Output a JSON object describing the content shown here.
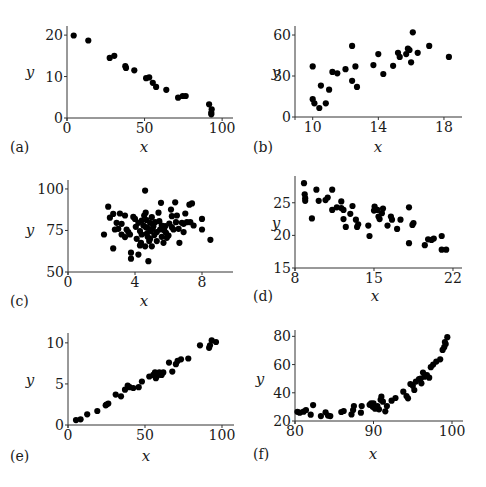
{
  "figure": {
    "background": "#ffffff",
    "point_color": "#000000",
    "axis_color": "#333333"
  },
  "chart_data": [
    {
      "id": "a",
      "type": "scatter",
      "panel_label": "(a)",
      "xlabel": "x",
      "ylabel": "y",
      "xlim": [
        0,
        107
      ],
      "ylim": [
        0,
        22
      ],
      "xticks": [
        0,
        50,
        100
      ],
      "yticks": [
        0,
        10,
        20
      ],
      "grid": false,
      "box": {
        "x0": 67,
        "x1": 233,
        "y0": 118,
        "y1": 26,
        "xmin": 0,
        "xmax": 107,
        "ymin": 0,
        "ymax": 22.2,
        "labelx": 10,
        "labely": 152,
        "axlabelx": 144,
        "axlabely": 152,
        "ylabx": 30,
        "ylaby": 77
      },
      "points": [
        [
          4.3,
          19.9
        ],
        [
          13.7,
          18.7
        ],
        [
          27.5,
          14.5
        ],
        [
          30.5,
          15.0
        ],
        [
          37.6,
          12.5
        ],
        [
          38.0,
          12.1
        ],
        [
          43.4,
          11.5
        ],
        [
          51.0,
          9.6
        ],
        [
          53.0,
          9.8
        ],
        [
          55.3,
          8.5
        ],
        [
          57.4,
          7.5
        ],
        [
          64.0,
          6.8
        ],
        [
          71.6,
          4.9
        ],
        [
          74.6,
          5.3
        ],
        [
          76.5,
          5.3
        ],
        [
          91.6,
          3.3
        ],
        [
          93.3,
          2.1
        ],
        [
          93.0,
          1.3
        ],
        [
          93.0,
          0.9
        ]
      ]
    },
    {
      "id": "b",
      "type": "scatter",
      "panel_label": "(b)",
      "xlabel": "x",
      "ylabel": "y",
      "xlim": [
        9.2,
        19.3
      ],
      "ylim": [
        0,
        66
      ],
      "xticks": [
        10,
        14,
        18
      ],
      "yticks": [
        0,
        30,
        60
      ],
      "grid": false,
      "box": {
        "x0": 295,
        "x1": 462,
        "y0": 117,
        "y1": 26,
        "xmin": 8.92,
        "xmax": 19.1,
        "ymin": 0,
        "ymax": 66.6,
        "labelx": 253,
        "labely": 152,
        "axlabelx": 378,
        "axlabely": 152,
        "ylabx": 276,
        "ylaby": 77
      },
      "points": [
        [
          10.0,
          37
        ],
        [
          10.0,
          13
        ],
        [
          10.1,
          10
        ],
        [
          10.4,
          6.6
        ],
        [
          10.5,
          23
        ],
        [
          10.8,
          10
        ],
        [
          11.0,
          20
        ],
        [
          11.2,
          33
        ],
        [
          11.5,
          32
        ],
        [
          12.0,
          35
        ],
        [
          12.4,
          52
        ],
        [
          12.4,
          26.5
        ],
        [
          12.6,
          37
        ],
        [
          12.7,
          22
        ],
        [
          13.7,
          38
        ],
        [
          14.0,
          46
        ],
        [
          14.3,
          31.5
        ],
        [
          14.9,
          37.5
        ],
        [
          15.2,
          47
        ],
        [
          15.3,
          44
        ],
        [
          15.7,
          46
        ],
        [
          15.8,
          50
        ],
        [
          15.9,
          49
        ],
        [
          16.0,
          40
        ],
        [
          16.1,
          62
        ],
        [
          16.4,
          47
        ],
        [
          17.1,
          52
        ],
        [
          18.3,
          44
        ]
      ]
    },
    {
      "id": "c",
      "type": "scatter",
      "panel_label": "(c)",
      "xlabel": "x",
      "ylabel": "y",
      "xlim": [
        0,
        9.8
      ],
      "ylim": [
        50,
        105
      ],
      "xticks": [
        0,
        4,
        8
      ],
      "yticks": [
        50,
        75,
        100
      ],
      "grid": false,
      "box": {
        "x0": 68,
        "x1": 233,
        "y0": 272,
        "y1": 180,
        "xmin": 0,
        "xmax": 9.85,
        "ymin": 50,
        "ymax": 105.4,
        "labelx": 10,
        "labely": 306,
        "axlabelx": 144,
        "axlabely": 306,
        "ylabx": 30,
        "ylaby": 235
      },
      "points": [
        [
          2.15,
          72.6
        ],
        [
          2.4,
          89.3
        ],
        [
          2.5,
          82.7
        ],
        [
          2.7,
          85
        ],
        [
          2.8,
          75.6
        ],
        [
          2.7,
          64.2
        ],
        [
          2.9,
          79.6
        ],
        [
          3.1,
          85.2
        ],
        [
          3.2,
          79
        ],
        [
          3.2,
          72.6
        ],
        [
          3.4,
          84
        ],
        [
          3.5,
          75.6
        ],
        [
          3.6,
          74
        ],
        [
          3.7,
          72.6
        ],
        [
          3.76,
          61.6
        ],
        [
          3.76,
          58
        ],
        [
          3.9,
          83.2
        ],
        [
          4.05,
          77.2
        ],
        [
          4.2,
          60.5
        ],
        [
          4.2,
          79.6
        ],
        [
          4.3,
          74.6
        ],
        [
          4.36,
          67.6
        ],
        [
          4.4,
          72.6
        ],
        [
          4.5,
          78
        ],
        [
          4.6,
          65.5
        ],
        [
          4.6,
          99
        ],
        [
          4.64,
          85.7
        ],
        [
          4.7,
          81.2
        ],
        [
          4.73,
          76.6
        ],
        [
          4.76,
          71.2
        ],
        [
          4.8,
          56.5
        ],
        [
          4.85,
          68.6
        ],
        [
          4.9,
          79.6
        ],
        [
          4.94,
          74.6
        ],
        [
          5.0,
          65.5
        ],
        [
          5.1,
          77.6
        ],
        [
          5.15,
          72.2
        ],
        [
          5.3,
          68.6
        ],
        [
          5.4,
          85.7
        ],
        [
          5.45,
          80.6
        ],
        [
          5.5,
          75.6
        ],
        [
          5.55,
          91.7
        ],
        [
          5.6,
          71.2
        ],
        [
          5.7,
          67.6
        ],
        [
          5.8,
          77.6
        ],
        [
          5.85,
          73.6
        ],
        [
          5.9,
          70.6
        ],
        [
          6.05,
          79.2
        ],
        [
          6.15,
          87.6
        ],
        [
          6.2,
          83.6
        ],
        [
          6.3,
          75.6
        ],
        [
          6.4,
          92
        ],
        [
          6.45,
          80
        ],
        [
          6.6,
          76
        ],
        [
          6.65,
          67.6
        ],
        [
          6.8,
          79.6
        ],
        [
          6.9,
          74
        ],
        [
          7.0,
          85.2
        ],
        [
          7.1,
          80
        ],
        [
          7.25,
          90.5
        ],
        [
          7.4,
          91.3
        ],
        [
          7.5,
          78
        ],
        [
          8.0,
          82
        ],
        [
          8.0,
          75.6
        ],
        [
          8.5,
          69.4
        ],
        [
          4.4,
          81
        ],
        [
          4.55,
          84
        ],
        [
          4.7,
          73
        ],
        [
          5.0,
          83
        ],
        [
          5.3,
          74
        ],
        [
          5.6,
          78
        ],
        [
          3.0,
          76
        ],
        [
          3.4,
          71
        ],
        [
          4.1,
          70
        ],
        [
          4.3,
          66
        ],
        [
          4.9,
          70
        ],
        [
          5.2,
          80
        ],
        [
          6.0,
          72
        ],
        [
          6.2,
          77
        ],
        [
          6.5,
          84
        ],
        [
          6.9,
          79
        ],
        [
          7.3,
          80
        ],
        [
          4.0,
          82
        ],
        [
          4.65,
          77
        ],
        [
          5.05,
          76
        ],
        [
          5.75,
          75
        ]
      ]
    },
    {
      "id": "d",
      "type": "scatter",
      "panel_label": "(d)",
      "xlabel": "x",
      "ylabel": "y",
      "xlim": [
        8,
        23.2
      ],
      "ylim": [
        15,
        29
      ],
      "xticks": [
        8,
        15,
        22
      ],
      "yticks": [
        15,
        20,
        25
      ],
      "grid": false,
      "box": {
        "x0": 295,
        "x1": 462,
        "y0": 268,
        "y1": 176,
        "xmin": 8,
        "xmax": 22.8,
        "ymin": 15,
        "ymax": 29.1,
        "labelx": 253,
        "labely": 301,
        "axlabelx": 375,
        "axlabely": 301,
        "ylabx": 276,
        "ylaby": 228
      },
      "points": [
        [
          8.8,
          28
        ],
        [
          8.86,
          26.3
        ],
        [
          8.9,
          25.7
        ],
        [
          8.9,
          25.3
        ],
        [
          9.5,
          22.6
        ],
        [
          9.9,
          27
        ],
        [
          10.1,
          25.3
        ],
        [
          10.7,
          25.4
        ],
        [
          10.9,
          25.8
        ],
        [
          11.3,
          27
        ],
        [
          11.3,
          23.9
        ],
        [
          11.7,
          24.3
        ],
        [
          12.1,
          25.2
        ],
        [
          12.1,
          24.2
        ],
        [
          12.3,
          23.9
        ],
        [
          12.3,
          22.5
        ],
        [
          12.5,
          21.3
        ],
        [
          12.9,
          23.3
        ],
        [
          13.1,
          24.5
        ],
        [
          13.4,
          22.4
        ],
        [
          13.6,
          21.7
        ],
        [
          13.5,
          21.3
        ],
        [
          14.5,
          21.5
        ],
        [
          14.6,
          19.9
        ],
        [
          15.05,
          24.4
        ],
        [
          15.0,
          23.8
        ],
        [
          15.3,
          23.9
        ],
        [
          15.4,
          22.9
        ],
        [
          15.5,
          22.5
        ],
        [
          15.8,
          24.1
        ],
        [
          15.7,
          23.4
        ],
        [
          16.2,
          21.5
        ],
        [
          16.5,
          22.9
        ],
        [
          16.6,
          22.4
        ],
        [
          17.05,
          21
        ],
        [
          17.35,
          22.4
        ],
        [
          18.1,
          24.3
        ],
        [
          18.1,
          18.8
        ],
        [
          18.4,
          21.6
        ],
        [
          18.5,
          21.9
        ],
        [
          19.5,
          18.5
        ],
        [
          19.8,
          19.4
        ],
        [
          20.1,
          19.3
        ],
        [
          20.3,
          19.5
        ],
        [
          21.0,
          19.9
        ],
        [
          21.0,
          17.8
        ],
        [
          21.4,
          17.8
        ]
      ]
    },
    {
      "id": "e",
      "type": "scatter",
      "panel_label": "(e)",
      "xlabel": "x",
      "ylabel": "y",
      "xlim": [
        0,
        107
      ],
      "ylim": [
        0,
        11.2
      ],
      "xticks": [
        0,
        50,
        100
      ],
      "yticks": [
        0,
        5,
        10
      ],
      "grid": false,
      "box": {
        "x0": 68,
        "x1": 234,
        "y0": 425,
        "y1": 333,
        "xmin": 0,
        "xmax": 107.8,
        "ymin": 0,
        "ymax": 11.2,
        "labelx": 10,
        "labely": 461,
        "axlabelx": 146,
        "axlabely": 461,
        "ylabx": 30,
        "ylaby": 385
      },
      "points": [
        [
          5.2,
          0.6
        ],
        [
          8.2,
          0.7
        ],
        [
          12.5,
          1.3
        ],
        [
          19,
          1.7
        ],
        [
          24.5,
          2.4
        ],
        [
          26.2,
          2.6
        ],
        [
          31,
          3.7
        ],
        [
          34.4,
          3.5
        ],
        [
          37,
          4.3
        ],
        [
          38.8,
          4.8
        ],
        [
          42.4,
          4.5
        ],
        [
          45.9,
          4.6
        ],
        [
          48,
          5.3
        ],
        [
          52.8,
          5.9
        ],
        [
          55.4,
          6.1
        ],
        [
          56.5,
          6.4
        ],
        [
          57.1,
          5.7
        ],
        [
          59.3,
          6.4
        ],
        [
          60.8,
          6.1
        ],
        [
          61.9,
          6.4
        ],
        [
          65.6,
          7.6
        ],
        [
          67.7,
          6.5
        ],
        [
          70.1,
          7.4
        ],
        [
          71.2,
          7.8
        ],
        [
          73.4,
          8.0
        ],
        [
          78.1,
          8.1
        ],
        [
          85.7,
          9.7
        ],
        [
          91.6,
          9.4
        ],
        [
          92.2,
          9.7
        ],
        [
          93.3,
          10.3
        ],
        [
          96.1,
          10.1
        ],
        [
          25,
          2.5
        ],
        [
          40,
          4.6
        ],
        [
          58,
          6.0
        ]
      ]
    },
    {
      "id": "f",
      "type": "scatter",
      "panel_label": "(f)",
      "xlabel": "x",
      "ylabel": "y",
      "xlim": [
        80,
        101.5
      ],
      "ylim": [
        20,
        84
      ],
      "xticks": [
        80,
        90,
        100
      ],
      "yticks": [
        20,
        40,
        60,
        80
      ],
      "grid": false,
      "box": {
        "x0": 295,
        "x1": 463,
        "y0": 421,
        "y1": 330,
        "xmin": 80,
        "xmax": 101.4,
        "ymin": 20,
        "ymax": 84.5,
        "labelx": 253,
        "labely": 459,
        "axlabelx": 373,
        "axlabely": 459,
        "ylabx": 260,
        "ylaby": 384
      },
      "points": [
        [
          80.6,
          25.9
        ],
        [
          81.1,
          26.6
        ],
        [
          81.4,
          27.8
        ],
        [
          82.0,
          24.5
        ],
        [
          82.3,
          31.3
        ],
        [
          83.3,
          23.5
        ],
        [
          83.9,
          26.2
        ],
        [
          84.2,
          23.8
        ],
        [
          84.5,
          23.5
        ],
        [
          85.9,
          26.4
        ],
        [
          86.2,
          27.1
        ],
        [
          87.2,
          24.7
        ],
        [
          87.4,
          27.8
        ],
        [
          87.5,
          30.6
        ],
        [
          88.4,
          25.9
        ],
        [
          88.5,
          30.6
        ],
        [
          89.7,
          32.5
        ],
        [
          89.9,
          30.1
        ],
        [
          90.2,
          28.7
        ],
        [
          90.5,
          30.6
        ],
        [
          90.7,
          28.3
        ],
        [
          91.0,
          37.2
        ],
        [
          91.2,
          33.7
        ],
        [
          91.5,
          26.9
        ],
        [
          91.7,
          30.6
        ],
        [
          92.3,
          34.4
        ],
        [
          92.8,
          36.3
        ],
        [
          93.8,
          40.8
        ],
        [
          94.2,
          37.7
        ],
        [
          94.4,
          36.1
        ],
        [
          94.7,
          46.2
        ],
        [
          95.2,
          42
        ],
        [
          95.4,
          47.9
        ],
        [
          95.8,
          49.6
        ],
        [
          96.1,
          46.7
        ],
        [
          96.3,
          54.3
        ],
        [
          96.5,
          51.4
        ],
        [
          96.8,
          52.6
        ],
        [
          97.1,
          50.7
        ],
        [
          97.3,
          58.1
        ],
        [
          98.0,
          62.1
        ],
        [
          98.5,
          63.7
        ],
        [
          98.8,
          70.4
        ],
        [
          99.0,
          72.3
        ],
        [
          99.2,
          74.6
        ],
        [
          99.4,
          79.4
        ],
        [
          80.3,
          26.5
        ],
        [
          89.5,
          31.5
        ],
        [
          90.0,
          32.5
        ],
        [
          90.9,
          35
        ],
        [
          95.0,
          45
        ],
        [
          96.0,
          50
        ],
        [
          97.6,
          60
        ],
        [
          99.1,
          76
        ]
      ]
    }
  ]
}
